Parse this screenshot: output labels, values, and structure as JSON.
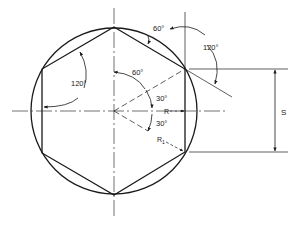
{
  "diagram": {
    "colors": {
      "background": "#ffffff",
      "stroke": "#1a1a1a"
    },
    "center": {
      "x": 114,
      "y": 111
    },
    "circle_radius": 83,
    "labels": {
      "top_edge_angle": "60°",
      "outer_angle": "120°",
      "left_interior_angle": "120°",
      "center_angle": "60°",
      "upper_half_angle": "30°",
      "lower_half_angle": "30°",
      "inner_radius": "R",
      "outer_radius": "R",
      "outer_radius_subscript": "1",
      "width_across_flats": "S"
    }
  }
}
